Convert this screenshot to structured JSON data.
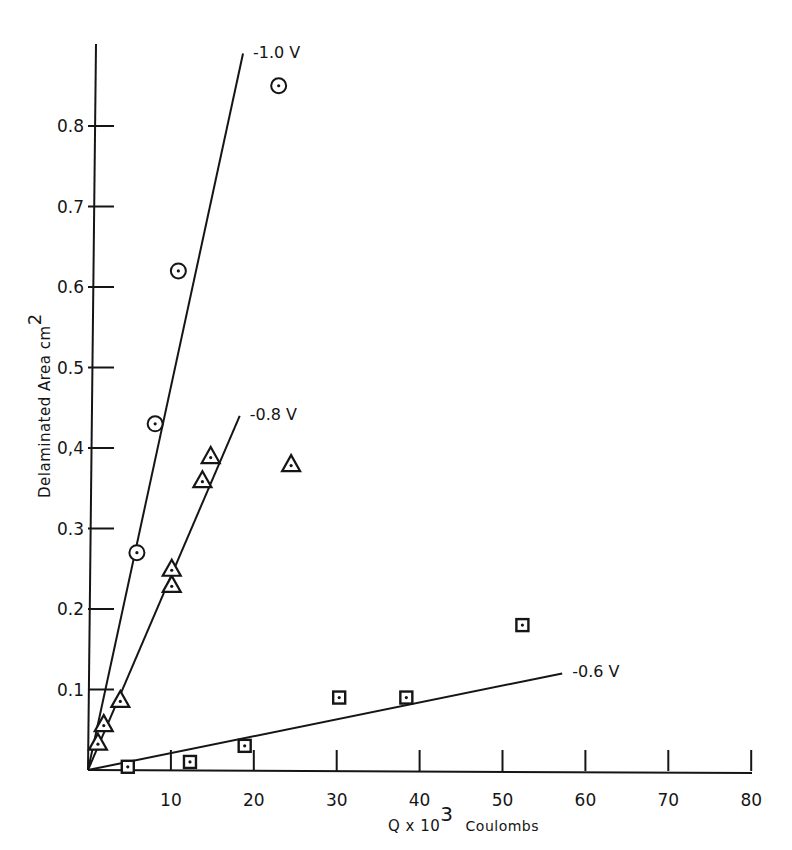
{
  "chart_data": {
    "type": "scatter",
    "title": "",
    "xlabel": "Q x 10^3 Coulombs",
    "xlabel_parts": {
      "base": "Q x 10",
      "exp": "3",
      "unit": "Coulombs"
    },
    "ylabel": "Delaminated Area cm^2",
    "ylabel_parts": {
      "base": "Delaminated  Area  cm",
      "exp": "2"
    },
    "xlim": [
      0,
      80
    ],
    "ylim": [
      0,
      0.9
    ],
    "grid": false,
    "legend": "none (series labelled at end of fit lines)",
    "x_ticks": [
      10,
      20,
      30,
      40,
      50,
      60,
      70,
      80
    ],
    "x_tick_labels": [
      "10",
      "20",
      "30",
      "40",
      "50",
      "60",
      "70",
      "80"
    ],
    "y_ticks": [
      0.1,
      0.2,
      0.3,
      0.4,
      0.5,
      0.6,
      0.7,
      0.8
    ],
    "y_tick_labels": [
      "0.1",
      "0.2",
      "0.3",
      "0,4",
      "0.5",
      "0.6",
      "0.7",
      "0.8"
    ],
    "series": [
      {
        "name": "-1.0 V",
        "label": "-1.0 V",
        "marker": "circle-dot",
        "points": [
          [
            5.9,
            0.27
          ],
          [
            8.1,
            0.43
          ],
          [
            10.9,
            0.62
          ],
          [
            23.0,
            0.85
          ]
        ],
        "fit_line": {
          "from": [
            0,
            0
          ],
          "to": [
            18.7,
            0.89
          ]
        }
      },
      {
        "name": "-0.8 V",
        "label": "-0.8 V",
        "marker": "triangle-dot",
        "points": [
          [
            1.2,
            0.034
          ],
          [
            1.9,
            0.057
          ],
          [
            3.9,
            0.087
          ],
          [
            10.1,
            0.23
          ],
          [
            10.1,
            0.25
          ],
          [
            13.8,
            0.36
          ],
          [
            14.8,
            0.39
          ],
          [
            24.5,
            0.38
          ]
        ],
        "fit_line": {
          "from": [
            0,
            0
          ],
          "to": [
            18.3,
            0.44
          ]
        }
      },
      {
        "name": "-0.6 V",
        "label": "-0.6 V",
        "marker": "square-dot",
        "points": [
          [
            4.8,
            0.004
          ],
          [
            12.3,
            0.01
          ],
          [
            18.9,
            0.03
          ],
          [
            30.3,
            0.09
          ],
          [
            38.4,
            0.09
          ],
          [
            52.4,
            0.18
          ]
        ],
        "fit_line": {
          "from": [
            0,
            0
          ],
          "to": [
            57.2,
            0.12
          ]
        }
      }
    ]
  }
}
